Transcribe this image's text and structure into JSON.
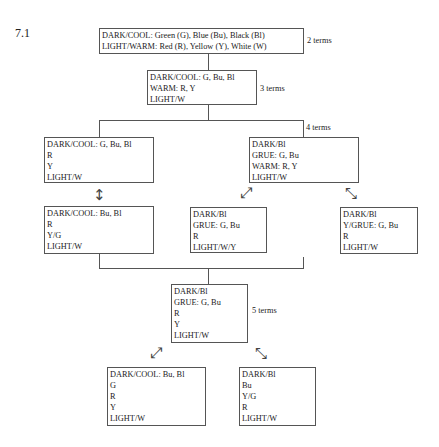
{
  "figure": {
    "label": "7.1"
  },
  "boxes": {
    "two_terms": {
      "lines": [
        "DARK/COOL: Green (G), Blue (Bu), Black (Bl)",
        "LIGHT/WARM: Red (R), Yellow (Y), White (W)"
      ],
      "terms_label": "2 terms"
    },
    "three_terms": {
      "lines": [
        "DARK/COOL: G, Bu, Bl",
        "WARM: R, Y",
        "LIGHT/W"
      ],
      "terms_label": "3 terms"
    },
    "four_terms_left": {
      "lines": [
        "DARK/COOL: G, Bu, Bl",
        "R",
        "Y",
        "LIGHT/W"
      ]
    },
    "four_terms_right": {
      "lines": [
        "DARK/Bl",
        "GRUE: G, Bu",
        "WARM: R, Y",
        "LIGHT/W"
      ],
      "terms_label": "4 terms"
    },
    "variant_a": {
      "lines": [
        "DARK/COOL: Bu, Bl",
        "R",
        "Y/G",
        "LIGHT/W"
      ]
    },
    "variant_b": {
      "lines": [
        "DARK/Bl",
        "GRUE: G, Bu",
        "R",
        "LIGHT/W/Y"
      ]
    },
    "variant_c": {
      "lines": [
        "DARK/Bl",
        "Y/GRUE: G, Bu",
        "R",
        "LIGHT/W"
      ]
    },
    "five_terms": {
      "lines": [
        "DARK/Bl",
        "GRUE: G, Bu",
        "R",
        "Y",
        "LIGHT/W"
      ],
      "terms_label": "5 terms"
    },
    "variant_d": {
      "lines": [
        "DARK/COOL: Bu, Bl",
        "G",
        "R",
        "Y",
        "LIGHT/W"
      ]
    },
    "variant_e": {
      "lines": [
        "DARK/Bl",
        "Bu",
        "Y/G",
        "R",
        "LIGHT/W"
      ]
    }
  },
  "arrows": {
    "vertical_double": "↕",
    "diag_ne_sw": "⤢",
    "diag_nw_se": "⤡"
  }
}
